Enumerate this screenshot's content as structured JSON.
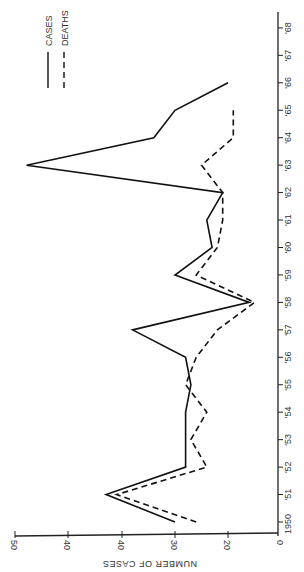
{
  "chart_data": {
    "type": "line",
    "orientation": "rotated-90-clockwise",
    "title": "",
    "xlabel": "",
    "ylabel": "NUMBER OF CASES",
    "x": [
      1950,
      1951,
      1952,
      1953,
      1954,
      1955,
      1956,
      1957,
      1958,
      1959,
      1960,
      1961,
      1962,
      1963,
      1964,
      1965,
      1966,
      1967,
      1968
    ],
    "x_tick_labels": [
      "1950",
      "'51",
      "'52",
      "'53",
      "'54",
      "'55",
      "'56",
      "'57",
      "'58",
      "'59",
      "'60",
      "'61",
      "'62",
      "'63",
      "'64",
      "'65",
      "'66",
      "'67",
      "'68"
    ],
    "y_tick_labels": [
      "50",
      "40",
      "40",
      "30",
      "20",
      "0"
    ],
    "series": [
      {
        "name": "CASES",
        "style": "solid",
        "x": [
          1950,
          1951,
          1952,
          1953,
          1954,
          1955,
          1956,
          1957,
          1958,
          1959,
          1960,
          1961,
          1962,
          1963,
          1964,
          1965,
          1966
        ],
        "values": [
          30,
          43,
          28,
          28,
          28,
          27,
          28,
          38,
          16,
          30,
          23,
          24,
          21,
          58,
          34,
          30,
          20
        ]
      },
      {
        "name": "DEATHS",
        "style": "dashed",
        "x": [
          1950,
          1951,
          1952,
          1953,
          1954,
          1955,
          1956,
          1957,
          1958,
          1959,
          1960,
          1961,
          1962,
          1963,
          1964,
          1965
        ],
        "values": [
          26,
          41,
          24,
          27,
          24,
          28,
          26,
          22,
          15,
          26,
          22,
          21,
          21,
          25,
          19,
          19
        ]
      }
    ],
    "legend": {
      "position": "upper-left (rotated)",
      "entries": [
        {
          "label": "CASES",
          "style": "solid"
        },
        {
          "label": "DEATHS",
          "style": "dashed"
        }
      ]
    },
    "grid": false
  },
  "legend": {
    "cases_label": "CASES",
    "deaths_label": "DEATHS"
  },
  "axes": {
    "value_axis_title": "NUMBER OF CASES"
  }
}
